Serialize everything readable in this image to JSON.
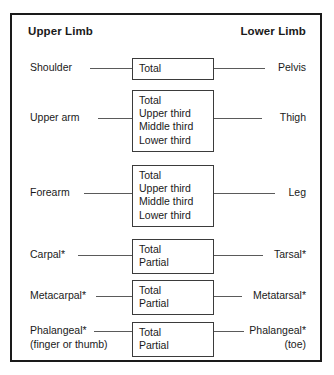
{
  "diagram": {
    "title_left": "Upper Limb",
    "title_right": "Lower Limb",
    "rows": [
      {
        "left_label": "Shoulder",
        "left_sub": "",
        "right_label": "Pelvis",
        "right_sub": "",
        "options": [
          "Total"
        ]
      },
      {
        "left_label": "Upper arm",
        "left_sub": "",
        "right_label": "Thigh",
        "right_sub": "",
        "options": [
          "Total",
          "Upper third",
          "Middle third",
          "Lower third"
        ]
      },
      {
        "left_label": "Forearm",
        "left_sub": "",
        "right_label": "Leg",
        "right_sub": "",
        "options": [
          "Total",
          "Upper third",
          "Middle third",
          "Lower third"
        ]
      },
      {
        "left_label": "Carpal*",
        "left_sub": "",
        "right_label": "Tarsal*",
        "right_sub": "",
        "options": [
          "Total",
          "Partial"
        ]
      },
      {
        "left_label": "Metacarpal*",
        "left_sub": "",
        "right_label": "Metatarsal*",
        "right_sub": "",
        "options": [
          "Total",
          "Partial"
        ]
      },
      {
        "left_label": "Phalangeal*",
        "left_sub": "(finger or thumb)",
        "right_label": "Phalangeal*",
        "right_sub": "(toe)",
        "options": [
          "Total",
          "Partial"
        ]
      }
    ],
    "colors": {
      "frame": "#1a1a1a",
      "box_border": "#3b3b3b",
      "connector": "#5a5a5a",
      "text": "#1a1a1a",
      "background": "#ffffff"
    }
  }
}
